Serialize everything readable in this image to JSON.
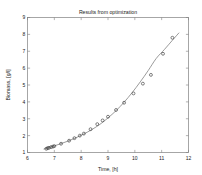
{
  "chart_data": {
    "type": "scatter",
    "title": "Results from optimization",
    "xlabel": "Time, [h]",
    "ylabel": "Biomass, [g/l]",
    "xlim": [
      6,
      12
    ],
    "ylim": [
      1,
      9
    ],
    "xticks": [
      6,
      7,
      8,
      9,
      10,
      11,
      12
    ],
    "yticks": [
      1,
      2,
      3,
      4,
      5,
      6,
      7,
      8,
      9
    ],
    "grid": false,
    "legend": null,
    "series": [
      {
        "name": "measured data",
        "style": "markers",
        "marker": "circle",
        "color": "#3c3c3c",
        "x": [
          6.7,
          6.75,
          6.8,
          6.88,
          6.95,
          7.0,
          7.25,
          7.55,
          7.75,
          7.95,
          8.1,
          8.35,
          8.6,
          8.8,
          9.0,
          9.3,
          9.6,
          9.95,
          10.3,
          10.6,
          11.05,
          11.4
        ],
        "y": [
          1.22,
          1.26,
          1.28,
          1.32,
          1.35,
          1.38,
          1.52,
          1.7,
          1.85,
          2.0,
          2.12,
          2.38,
          2.68,
          2.9,
          3.12,
          3.52,
          3.95,
          4.5,
          5.08,
          5.6,
          6.85,
          7.8
        ]
      },
      {
        "name": "fitted model",
        "style": "line",
        "color": "#7a7a7a",
        "x": [
          6.6,
          6.9,
          7.2,
          7.5,
          7.8,
          8.1,
          8.4,
          8.7,
          9.0,
          9.3,
          9.6,
          9.9,
          10.2,
          10.5,
          10.8,
          11.1,
          11.4,
          11.65
        ],
        "y": [
          1.2,
          1.34,
          1.5,
          1.67,
          1.87,
          2.1,
          2.36,
          2.67,
          3.05,
          3.48,
          3.98,
          4.55,
          5.18,
          5.86,
          6.58,
          7.1,
          7.65,
          8.1
        ]
      }
    ]
  }
}
